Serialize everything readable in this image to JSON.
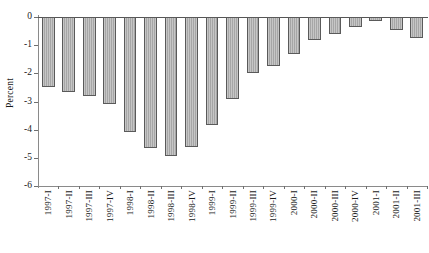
{
  "chart_data": {
    "type": "bar",
    "title": "",
    "xlabel": "",
    "ylabel": "Percent",
    "ylim": [
      -6,
      0
    ],
    "yticks": [
      0,
      -1,
      -2,
      -3,
      -4,
      -5,
      -6
    ],
    "ytick_labels": [
      "0",
      "-1",
      "-2",
      "-3",
      "-4",
      "-5",
      "-6"
    ],
    "grid": false,
    "legend": "none",
    "orientation": "vertical",
    "bar_style": {
      "fill": "#b9b9b9",
      "hatch": "vertical-stripes",
      "edge": "#5a5a5a"
    },
    "categories": [
      "1997-I",
      "1997-II",
      "1997-III",
      "1997-IV",
      "1998-I",
      "1998-II",
      "1998-III",
      "1998-IV",
      "1999-I",
      "1999-II",
      "1999-III",
      "1999-IV",
      "2000-I",
      "2000-II",
      "2000-III",
      "2000-IV",
      "2001-I",
      "2001-II",
      "2001-III"
    ],
    "values": [
      -2.5,
      -2.65,
      -2.8,
      -3.1,
      -4.1,
      -4.65,
      -4.95,
      -4.6,
      -3.85,
      -2.9,
      -2.0,
      -1.75,
      -1.3,
      -0.8,
      -0.6,
      -0.35,
      -0.15,
      -0.45,
      -0.75
    ]
  }
}
